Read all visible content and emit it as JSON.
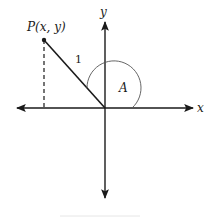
{
  "diagram": {
    "type": "unit-circle-angle",
    "labels": {
      "point": "P(x, y)",
      "radius": "1",
      "angle": "A",
      "x_axis": "x",
      "y_axis": "y"
    },
    "point_position": "second-quadrant",
    "colors": {
      "stroke": "#1a1a1a",
      "arc": "#555555",
      "background": "#ffffff",
      "footer_rule": "#e6e6e6"
    }
  }
}
